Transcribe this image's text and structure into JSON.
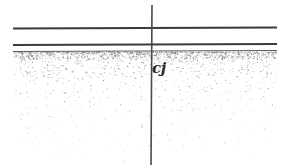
{
  "drawing": {
    "title": "Construction joint section detail",
    "background_color": "#ffffff",
    "width": 288,
    "height": 168,
    "label": {
      "text": "cj",
      "meaning": "construction-joint",
      "x": 152,
      "y": 61,
      "font_size": 15,
      "color": "#2c2c2c"
    },
    "lines": {
      "top_slab_line": {
        "name": "top-surface-line",
        "x1": 13,
        "y1": 28.5,
        "x2": 277,
        "y2": 27.5,
        "width": 2.2,
        "color": "#3a3a3a"
      },
      "second_line": {
        "name": "slab-underside-line",
        "x1": 13,
        "y1": 45.0,
        "x2": 277,
        "y2": 44.0,
        "width": 2.0,
        "color": "#3a3a3a"
      },
      "third_line": {
        "name": "subgrade-line",
        "x1": 13,
        "y1": 51.5,
        "x2": 277,
        "y2": 50.5,
        "width": 1.0,
        "color": "#5a5a5a"
      },
      "vertical_joint_line": {
        "name": "vertical-joint-line",
        "x1": 152,
        "y1": 5,
        "x2": 151,
        "y2": 165,
        "width": 1.6,
        "color": "#4a4a4a"
      }
    },
    "hatch": {
      "name": "soil-stipple-fill",
      "description": "stippled soil / compacted fill texture",
      "region": {
        "x": 14,
        "y": 52,
        "width": 262,
        "height": 114
      },
      "dot_color": "#6a6a6a",
      "density_top": "dense",
      "density_bottom": "sparse"
    }
  }
}
